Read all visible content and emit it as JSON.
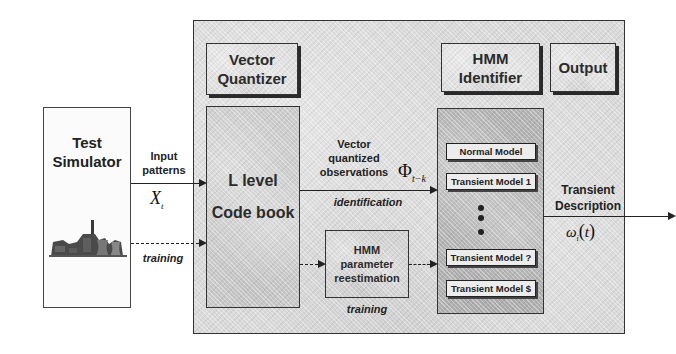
{
  "diagram": {
    "type": "block-diagram"
  },
  "test_simulator": {
    "title_line1": "Test",
    "title_line2": "Simulator",
    "icon": "power-plant-icon"
  },
  "input_edge": {
    "label_line1": "Input",
    "label_line2": "patterns",
    "symbol": "X",
    "symbol_sub": "t"
  },
  "training_edge_left": {
    "label": "training"
  },
  "vector_quantizer": {
    "title_line1": "Vector",
    "title_line2": "Quantizer"
  },
  "codebook": {
    "line1": "L level",
    "line2": "Code book"
  },
  "observations_edge": {
    "label_line1": "Vector",
    "label_line2": "quantized",
    "label_line3": "observations",
    "symbol": "Φ",
    "symbol_sub": "t−k",
    "caption": "identification"
  },
  "reestimation": {
    "line1": "HMM",
    "line2": "parameter",
    "line3": "reestimation",
    "caption": "training"
  },
  "hmm_identifier": {
    "title_line1": "HMM",
    "title_line2": "Identifier",
    "models": [
      {
        "label": "Normal   Model"
      },
      {
        "label": "Transient Model 1"
      },
      {
        "label": "Transient Model ?"
      },
      {
        "label": "Transient Model $"
      }
    ],
    "ellipsis_dots": 3
  },
  "output": {
    "title": "Output",
    "edge_line1": "Transient",
    "edge_line2": "Description",
    "symbol": "ω",
    "symbol_sub": "i",
    "symbol_arg": "t"
  },
  "colors": {
    "frame_bg": "#d9d9d9",
    "codebook_bg": "#cfcfcf",
    "models_bg": "#b0b0b0",
    "model_box_bg": "#ececec",
    "line": "#222222"
  }
}
